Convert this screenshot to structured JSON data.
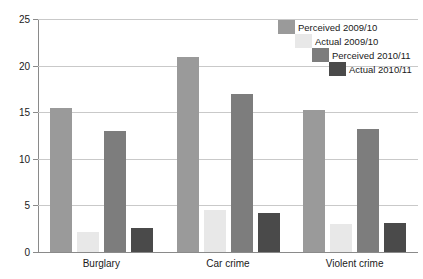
{
  "chart_data": {
    "type": "bar",
    "title": "",
    "xlabel": "",
    "ylabel": "",
    "ylim": [
      0,
      25
    ],
    "yticks": [
      0,
      5,
      10,
      15,
      20,
      25
    ],
    "grid": true,
    "legend_position": "top-right",
    "categories": [
      "Burglary",
      "Car crime",
      "Violent crime"
    ],
    "series": [
      {
        "name": "Perceived 2009/10",
        "color": "#9a9a9a",
        "values": [
          15.4,
          20.9,
          15.2
        ]
      },
      {
        "name": "Actual 2009/10",
        "color": "#e8e8e8",
        "values": [
          2.2,
          4.5,
          3.0
        ]
      },
      {
        "name": "Perceived 2010/11",
        "color": "#7d7d7d",
        "values": [
          13.0,
          17.0,
          13.2
        ]
      },
      {
        "name": "Actual 2010/11",
        "color": "#4a4a4a",
        "values": [
          2.6,
          4.2,
          3.1
        ]
      }
    ]
  }
}
